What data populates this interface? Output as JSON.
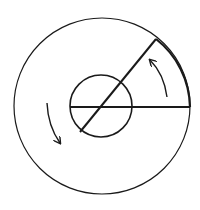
{
  "diagram": {
    "colors": {
      "stroke": "#1a1a1a",
      "background": "#ffffff"
    },
    "outer_circle": {
      "cx": 102,
      "cy": 106,
      "r": 88
    },
    "inner_circle": {
      "cx": 101,
      "cy": 106,
      "r": 31
    },
    "horizontal_line": {
      "x1": 70,
      "y1": 107,
      "x2": 190,
      "y2": 107
    },
    "diagonal_line": {
      "x1": 80,
      "y1": 132,
      "x2": 156,
      "y2": 39
    },
    "sector_arc": {
      "from": [
        156,
        39
      ],
      "to": [
        190,
        107
      ]
    },
    "arrows": [
      {
        "name": "counterclockwise-arrow-right",
        "direction": "up"
      },
      {
        "name": "rotation-arrow-left",
        "direction": "down"
      }
    ]
  }
}
